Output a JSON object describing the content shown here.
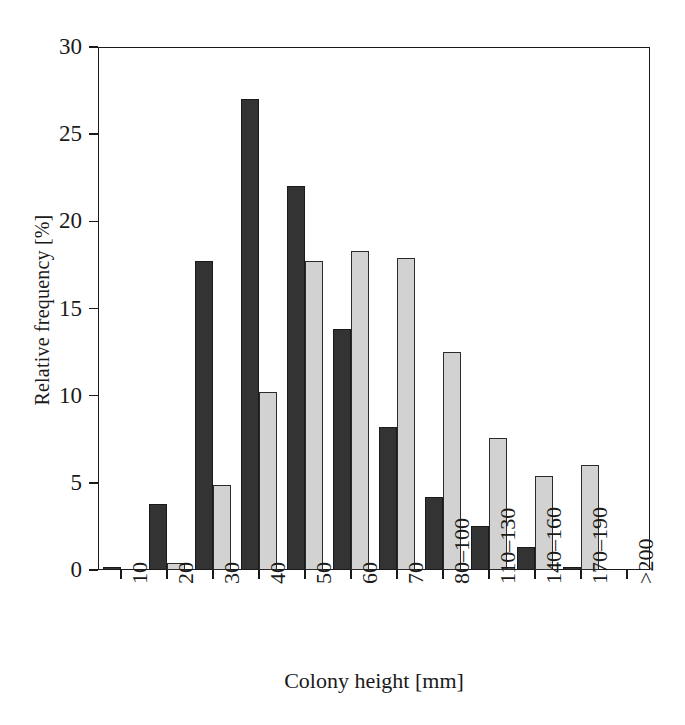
{
  "chart_data": {
    "type": "bar",
    "title": "",
    "subtitle": "",
    "xlabel": "Colony height [mm]",
    "ylabel": "Relative frequency [%]",
    "categories": [
      "10",
      "20",
      "30",
      "40",
      "50",
      "60",
      "70",
      "80–100",
      "110–130",
      "140–160",
      "170–190",
      ">200"
    ],
    "tick_labels": [
      "10",
      "20",
      "30",
      "40",
      "50",
      "60",
      "70",
      "80–100",
      "110–130",
      "140–160",
      "170–190",
      ">200"
    ],
    "series": [
      {
        "name": "dark",
        "color": "#333333",
        "values": [
          0.2,
          3.8,
          17.7,
          27.0,
          22.0,
          13.8,
          8.2,
          4.2,
          2.5,
          1.3,
          0.2,
          0.0
        ]
      },
      {
        "name": "light",
        "color": "#d2d2d2",
        "values": [
          0.0,
          0.4,
          4.9,
          10.2,
          17.7,
          18.3,
          17.9,
          12.5,
          7.6,
          5.4,
          6.0,
          0.0
        ]
      }
    ],
    "ylim": [
      0,
      30
    ],
    "yticks": [
      0,
      5,
      10,
      15,
      20,
      25,
      30
    ],
    "ytick_labels": [
      "0",
      "5",
      "10",
      "15",
      "20",
      "25",
      "30"
    ],
    "grid": false,
    "legend": "none",
    "axis_color": "#1a1a1a",
    "background": "#ffffff"
  }
}
